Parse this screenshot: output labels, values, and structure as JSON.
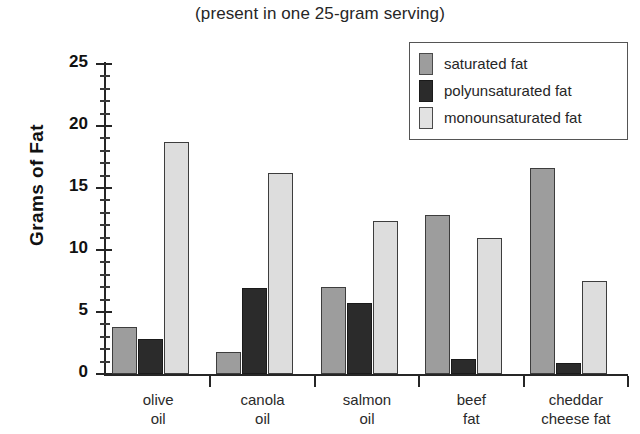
{
  "chart_data": {
    "type": "bar",
    "title": "(present in one 25-gram serving)",
    "xlabel": "",
    "ylabel": "Grams of Fat",
    "ylim": [
      0,
      25
    ],
    "ytick_labels": [
      "0",
      "5",
      "10",
      "15",
      "20",
      "25"
    ],
    "ytick_values": [
      0,
      5,
      10,
      15,
      20,
      25
    ],
    "yminor_step": 1,
    "grid": false,
    "legend_position": "top-right",
    "categories": [
      "olive\noil",
      "canola\noil",
      "salmon\noil",
      "beef\nfat",
      "cheddar\ncheese fat"
    ],
    "category_lines": [
      [
        "olive",
        "oil"
      ],
      [
        "canola",
        "oil"
      ],
      [
        "salmon",
        "oil"
      ],
      [
        "beef",
        "fat"
      ],
      [
        "cheddar",
        "cheese fat"
      ]
    ],
    "series": [
      {
        "name": "saturated fat",
        "color": "#9d9d9d",
        "values": [
          3.8,
          1.8,
          7.0,
          12.8,
          16.6
        ]
      },
      {
        "name": "polyunsaturated fat",
        "color": "#2b2b2b",
        "values": [
          2.8,
          6.9,
          5.7,
          1.2,
          0.9
        ]
      },
      {
        "name": "monounsaturated fat",
        "color": "#dddddd",
        "values": [
          18.7,
          16.2,
          12.3,
          11.0,
          7.5
        ]
      }
    ]
  },
  "legend": {
    "items": [
      {
        "label": "saturated fat",
        "swatch": "sat"
      },
      {
        "label": "polyunsaturated fat",
        "swatch": "poly"
      },
      {
        "label": "monounsaturated fat",
        "swatch": "mono"
      }
    ]
  }
}
